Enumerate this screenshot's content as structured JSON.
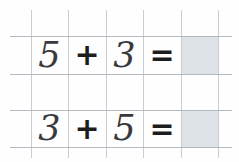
{
  "worksheet": {
    "title": "Addition facts grid",
    "background_color": "#fefefe",
    "grid": {
      "line_color": "#c9cdd2",
      "rule_color": "#b4b9bf",
      "vertical_x": [
        31,
        68,
        106,
        143,
        181,
        218
      ],
      "horizontal_y": [
        36,
        74,
        110,
        147
      ]
    },
    "answer_cell_color": "#dde3e6",
    "digit_color": "#3a3a3c",
    "operator_color": "#1d1d1f"
  },
  "rows": [
    {
      "id": "row-1",
      "cells": [
        {
          "name": "addend-1",
          "text": "5",
          "kind": "digit"
        },
        {
          "name": "plus-operator",
          "text": "+",
          "kind": "plus"
        },
        {
          "name": "addend-2",
          "text": "3",
          "kind": "digit"
        },
        {
          "name": "equals-operator",
          "text": "=",
          "kind": "equals"
        },
        {
          "name": "answer-box",
          "text": "",
          "kind": "answer"
        }
      ]
    },
    {
      "id": "row-2",
      "cells": [
        {
          "name": "addend-1",
          "text": "3",
          "kind": "digit"
        },
        {
          "name": "plus-operator",
          "text": "+",
          "kind": "plus"
        },
        {
          "name": "addend-2",
          "text": "5",
          "kind": "digit"
        },
        {
          "name": "equals-operator",
          "text": "=",
          "kind": "equals"
        },
        {
          "name": "answer-box",
          "text": "",
          "kind": "answer"
        }
      ]
    }
  ]
}
